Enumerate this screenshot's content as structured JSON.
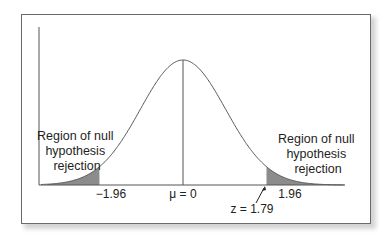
{
  "chart_data": {
    "type": "area",
    "title": "",
    "xlabel": "",
    "ylabel": "",
    "distribution": "standard normal",
    "mean": 0,
    "std": 1,
    "x_range": [
      -3.4,
      3.8
    ],
    "critical_values": [
      -1.96,
      1.96
    ],
    "observed_z": 1.79,
    "tick_labels": {
      "left_critical": "−1.96",
      "mean": "μ = 0",
      "right_critical": "1.96",
      "observed": "z = 1.79"
    },
    "shaded_regions": [
      {
        "name": "left-tail",
        "from": -3.4,
        "to": -1.96,
        "label": [
          "Region of null",
          "hypothesis",
          "rejection"
        ]
      },
      {
        "name": "right-tail",
        "from": 1.96,
        "to": 3.8,
        "label": [
          "Region of null",
          "hypothesis",
          "rejection"
        ]
      }
    ],
    "annotations": [
      {
        "text": "z = 1.79",
        "points_to": 1.79,
        "arrow": true
      }
    ],
    "grid": false,
    "legend": null
  },
  "layout": {
    "origin_x": 183,
    "baseline_y": 185,
    "peak_y": 60,
    "px_per_z": 42.6,
    "axis_top_y": 27,
    "axis_left_x": 39,
    "axis_right_x": 345
  },
  "colors": {
    "curve": "#555555",
    "tail_fill": "#8c8c8c",
    "axis": "#555555",
    "frame": "#6a6a6a"
  },
  "labels": {
    "left_region": [
      "Region of null",
      "hypothesis",
      "rejection"
    ],
    "right_region": [
      "Region of null",
      "hypothesis",
      "rejection"
    ],
    "minus_196": "−1.96",
    "mu": "μ = 0",
    "plus_196": "1.96",
    "z_obs": "z = 1.79"
  }
}
